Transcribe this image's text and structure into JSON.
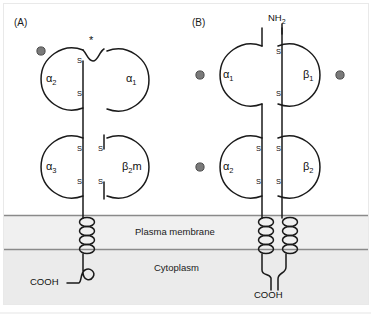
{
  "figure": {
    "caption_hidden": "",
    "background": "#ffffff",
    "border_color": "#e9e9e9"
  },
  "panels": [
    {
      "id": "A",
      "label": "(A)",
      "molecule": "MHC class I",
      "domains": [
        {
          "name": "alpha2",
          "label": "α2",
          "greek": "α",
          "sub": "2"
        },
        {
          "name": "alpha1",
          "label": "α1",
          "greek": "α",
          "sub": "1"
        },
        {
          "name": "alpha3",
          "label": "α3",
          "greek": "α",
          "sub": "3"
        },
        {
          "name": "beta2m",
          "label": "β2m",
          "greek": "β",
          "sub": "2",
          "suffix": "m"
        }
      ],
      "disulfide_label": "S",
      "disulfide_count": 4,
      "peptide_groove_marker": "*",
      "glycosylation_dots": 1,
      "c_terminus": "COOH",
      "n_terminus": "",
      "transmembrane_chains": 1,
      "helix_loops": 4
    },
    {
      "id": "B",
      "label": "(B)",
      "molecule": "MHC class II",
      "domains": [
        {
          "name": "alpha1",
          "label": "α1",
          "greek": "α",
          "sub": "1"
        },
        {
          "name": "beta1",
          "label": "β1",
          "greek": "β",
          "sub": "1"
        },
        {
          "name": "alpha2",
          "label": "α2",
          "greek": "α",
          "sub": "2"
        },
        {
          "name": "beta2",
          "label": "β2",
          "greek": "β",
          "sub": "2"
        }
      ],
      "disulfide_label": "S",
      "disulfide_count": 4,
      "glycosylation_dots": 3,
      "n_terminus": "NH2",
      "n_terminus_text": "NH",
      "n_terminus_sub": "2",
      "c_terminus": "COOH",
      "transmembrane_chains": 2,
      "helix_loops": 4
    }
  ],
  "bands": [
    {
      "name": "plasma-membrane",
      "label": "Plasma membrane",
      "fill": "#f0f0f0",
      "border": "#8a8a8a"
    },
    {
      "name": "cytoplasm",
      "label": "Cytoplasm",
      "fill": "#ebebeb",
      "border": "#8a8a8a"
    }
  ],
  "colors": {
    "stroke": "#1a1a1a",
    "glycosyl_dot": "#7a7a7a",
    "glycosyl_dot_border": "#4a4a4a",
    "membrane_fill": "#f0f0f0",
    "cytoplasm_fill": "#ebebeb",
    "band_line": "#8a8a8a",
    "text": "#101010"
  },
  "labels": {
    "s": "S",
    "cooh": "COOH",
    "nh2_text": "NH",
    "nh2_sub": "2",
    "asterisk": "*",
    "plasma_membrane": "Plasma membrane",
    "cytoplasm": "Cytoplasm",
    "panel_a": "(A)",
    "panel_b": "(B)"
  }
}
